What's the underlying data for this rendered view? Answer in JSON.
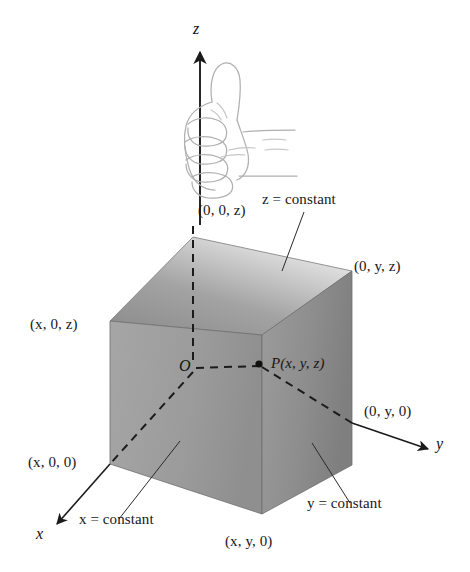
{
  "figure": {
    "background_color": "#ffffff",
    "ink_color": "#171717",
    "cube": {
      "top_face_color_light": "#e9e9e9",
      "top_face_color_dark": "#8e8e8e",
      "left_face_color": "#9a9a9a",
      "front_face_color": "#8c8c8c",
      "edge_color": "#6b6b6b"
    },
    "hand": {
      "icon": "thumbs-up-hand",
      "stroke_color": "#a9a9a9",
      "description": "right hand with thumb pointing up along the z axis"
    }
  },
  "axes": [
    {
      "id": "z",
      "label": "z",
      "direction": "up",
      "style": "solid-with-arrow"
    },
    {
      "id": "y",
      "label": "y",
      "direction": "right-down",
      "style": "solid-with-arrow"
    },
    {
      "id": "x",
      "label": "x",
      "direction": "left-down",
      "style": "solid-with-arrow"
    }
  ],
  "points": [
    {
      "id": "origin",
      "label": "O"
    },
    {
      "id": "P",
      "label": "P(x, y, z)"
    },
    {
      "id": "z-intercept",
      "label": "(0, 0, z)"
    },
    {
      "id": "yz-corner",
      "label": "(0, y, z)"
    },
    {
      "id": "xz-corner",
      "label": "(x, 0, z)"
    },
    {
      "id": "x-intercept",
      "label": "(x, 0, 0)"
    },
    {
      "id": "y-intercept",
      "label": "(0, y, 0)"
    },
    {
      "id": "xy-corner",
      "label": "(x, y, 0)"
    }
  ],
  "planes": [
    {
      "id": "z-plane",
      "label": "z = constant"
    },
    {
      "id": "y-plane",
      "label": "y = constant"
    },
    {
      "id": "x-plane",
      "label": "x = constant"
    }
  ],
  "labels": {
    "z_axis": "z",
    "y_axis": "y",
    "x_axis": "x",
    "origin": "O",
    "point_p": "P(x, y, z)",
    "p_prefix": "P",
    "p_coords": "(x, y, z)",
    "zero_zero_z": "(0, 0, z)",
    "zero_y_z": "(0, y, z)",
    "x_zero_z": "(x, 0, z)",
    "x_zero_zero": "(x, 0, 0)",
    "zero_y_zero": "(0, y, 0)",
    "x_y_zero": "(x, y, 0)",
    "z_constant": "z = constant",
    "y_constant": "y = constant",
    "x_constant": "x = constant"
  }
}
